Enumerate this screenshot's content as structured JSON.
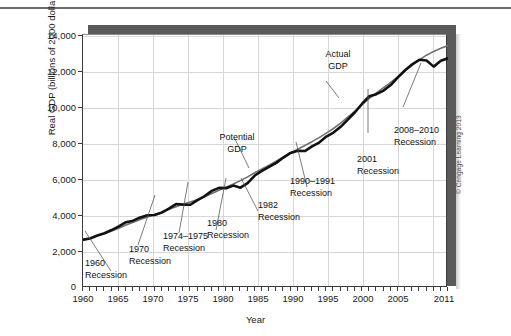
{
  "figure": {
    "credit": "© Cengage Learning 2013"
  },
  "chart_data": {
    "type": "line",
    "title": "",
    "xlabel": "Year",
    "ylabel": "Real GDP (billions of 2000 dollars)",
    "xlim": [
      1960,
      2011
    ],
    "ylim": [
      0,
      14800
    ],
    "grid": true,
    "legend_position": "none (inline annotations)",
    "y_ticks": [
      0,
      2000,
      4000,
      6000,
      8000,
      10000,
      12000,
      14000
    ],
    "y_tick_labels": [
      "0",
      "2,000",
      "4,000",
      "6,000",
      "8,000",
      "10,000",
      "12,000",
      "14,000"
    ],
    "x_ticks": [
      1960,
      1965,
      1970,
      1975,
      1980,
      1985,
      1990,
      1995,
      2000,
      2005,
      2011
    ],
    "x_tick_labels": [
      "1960",
      "1965",
      "1970",
      "1975",
      "1980",
      "1985",
      "1990",
      "1995",
      "2000",
      "2005",
      "2011"
    ],
    "x_minor_tick_interval": 1,
    "x": [
      1960,
      1961,
      1962,
      1963,
      1964,
      1965,
      1966,
      1967,
      1968,
      1969,
      1970,
      1971,
      1972,
      1973,
      1974,
      1975,
      1976,
      1977,
      1978,
      1979,
      1980,
      1981,
      1982,
      1983,
      1984,
      1985,
      1986,
      1987,
      1988,
      1989,
      1990,
      1991,
      1992,
      1993,
      1994,
      1995,
      1996,
      1997,
      1998,
      1999,
      2000,
      2001,
      2002,
      2003,
      2004,
      2005,
      2006,
      2007,
      2008,
      2009,
      2010,
      2011
    ],
    "series": [
      {
        "name": "Actual GDP",
        "color": "#111111",
        "width": 2.6,
        "values": [
          2830,
          2900,
          3070,
          3200,
          3390,
          3610,
          3850,
          3940,
          4130,
          4260,
          4270,
          4410,
          4640,
          4910,
          4880,
          4870,
          5140,
          5380,
          5680,
          5860,
          5840,
          5990,
          5870,
          6130,
          6580,
          6850,
          7090,
          7320,
          7630,
          7900,
          8030,
          8010,
          8280,
          8510,
          8860,
          9090,
          9430,
          9850,
          10280,
          10780,
          11220,
          11340,
          11550,
          11870,
          12320,
          12740,
          13090,
          13350,
          13310,
          12950,
          13290,
          13440
        ]
      },
      {
        "name": "Potential GDP",
        "color": "#707070",
        "width": 1.6,
        "values": [
          2800,
          2910,
          3050,
          3190,
          3340,
          3500,
          3680,
          3850,
          4010,
          4160,
          4300,
          4440,
          4600,
          4760,
          4910,
          5030,
          5170,
          5340,
          5530,
          5720,
          5900,
          6080,
          6280,
          6500,
          6740,
          6970,
          7190,
          7420,
          7660,
          7900,
          8120,
          8340,
          8560,
          8800,
          9060,
          9330,
          9640,
          9990,
          10350,
          10720,
          11090,
          11420,
          11720,
          12030,
          12370,
          12710,
          13030,
          13340,
          13620,
          13840,
          14030,
          14180
        ]
      }
    ],
    "annotations": [
      {
        "id": "actual-gdp",
        "label": "Actual\nGDP"
      },
      {
        "id": "potential-gdp",
        "label": "Potential\nGDP"
      },
      {
        "id": "recession-1960",
        "label": "1960\nRecession"
      },
      {
        "id": "recession-1970",
        "label": "1970\nRecession"
      },
      {
        "id": "recession-1974-1975",
        "label": "1974–1975\nRecession"
      },
      {
        "id": "recession-1980",
        "label": "1980\nRecession"
      },
      {
        "id": "recession-1982",
        "label": "1982\nRecession"
      },
      {
        "id": "recession-1990-1991",
        "label": "1990–1991\nRecession"
      },
      {
        "id": "recession-2001",
        "label": "2001\nRecession"
      },
      {
        "id": "recession-2008-2010",
        "label": "2008–2010\nRecession"
      }
    ]
  }
}
